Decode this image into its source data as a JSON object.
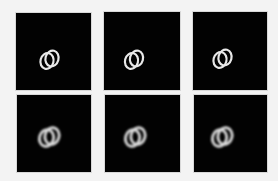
{
  "figure": {
    "background_color": "#f3f3f3",
    "panel_color": "#020202",
    "ring_color": "#e6e6e6",
    "rows": [
      {
        "style": "sharp",
        "panels": [
          {
            "id": "r1c1",
            "x": 16,
            "y": 13,
            "w": 75,
            "h": 77,
            "blur": 0,
            "ring_a": {
              "cx": 31,
              "cy": 47,
              "rx": 6.5,
              "ry": 8,
              "rot": 15
            },
            "ring_b": {
              "cx": 36,
              "cy": 45,
              "rx": 6.5,
              "ry": 8,
              "rot": 15
            }
          },
          {
            "id": "r1c2",
            "x": 104,
            "y": 12,
            "w": 76,
            "h": 78,
            "blur": 0,
            "ring_a": {
              "cx": 28,
              "cy": 48,
              "rx": 6.5,
              "ry": 8,
              "rot": 15
            },
            "ring_b": {
              "cx": 33,
              "cy": 46,
              "rx": 6.5,
              "ry": 8,
              "rot": 15
            }
          },
          {
            "id": "r1c3",
            "x": 193,
            "y": 12,
            "w": 74,
            "h": 78,
            "blur": 0,
            "ring_a": {
              "cx": 27,
              "cy": 47,
              "rx": 6.5,
              "ry": 8,
              "rot": 15
            },
            "ring_b": {
              "cx": 32,
              "cy": 45,
              "rx": 6.5,
              "ry": 8,
              "rot": 15
            }
          }
        ]
      },
      {
        "style": "blurred",
        "panels": [
          {
            "id": "r2c1",
            "x": 17,
            "y": 95,
            "w": 74,
            "h": 77,
            "blur": 1.1,
            "ring_a": {
              "cx": 30,
              "cy": 42,
              "rx": 7,
              "ry": 8.5,
              "rot": 15
            },
            "ring_b": {
              "cx": 35,
              "cy": 41,
              "rx": 7,
              "ry": 8.5,
              "rot": 15
            }
          },
          {
            "id": "r2c2",
            "x": 105,
            "y": 95,
            "w": 75,
            "h": 77,
            "blur": 1.1,
            "ring_a": {
              "cx": 28,
              "cy": 42,
              "rx": 7,
              "ry": 8.5,
              "rot": 15
            },
            "ring_b": {
              "cx": 33,
              "cy": 41,
              "rx": 7,
              "ry": 8.5,
              "rot": 15
            }
          },
          {
            "id": "r2c3",
            "x": 194,
            "y": 95,
            "w": 73,
            "h": 77,
            "blur": 1.1,
            "ring_a": {
              "cx": 26,
              "cy": 42,
              "rx": 7,
              "ry": 8.5,
              "rot": 15
            },
            "ring_b": {
              "cx": 31,
              "cy": 41,
              "rx": 7,
              "ry": 8.5,
              "rot": 15
            }
          }
        ]
      }
    ]
  }
}
